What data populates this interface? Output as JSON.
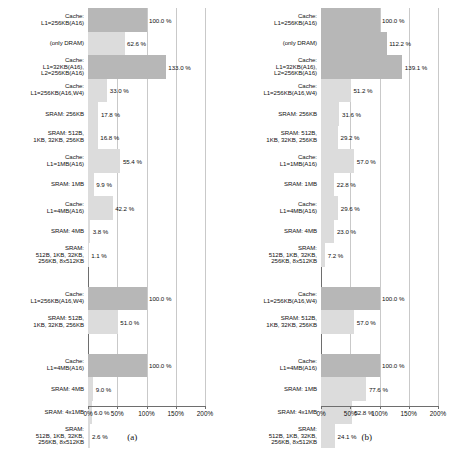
{
  "figure": {
    "type": "grouped-horizontal-bar-figure",
    "panels": 2
  },
  "axis": {
    "ticks": [
      "0%",
      "50%",
      "100%",
      "150%",
      "200%"
    ],
    "tick_values": [
      0,
      50,
      100,
      150,
      200
    ],
    "min": 0,
    "max": 200,
    "unit": "%"
  },
  "colors": {
    "bar_dark": "#b7b7b7",
    "bar_light": "#dcdcdc",
    "axis": "#6e6e6e",
    "grid": "#c9c9c9",
    "background": "#ffffff"
  },
  "panels": [
    {
      "caption": "(a)"
    },
    {
      "caption": "(b)"
    }
  ],
  "chart_data": [
    {
      "type": "bar",
      "orientation": "horizontal",
      "title": "(a)",
      "xlabel": "",
      "ylabel": "",
      "xlim": [
        0,
        200
      ],
      "xticks": [
        0,
        50,
        100,
        150,
        200
      ],
      "xticklabels": [
        "0%",
        "50%",
        "100%",
        "150%",
        "200%"
      ],
      "grid": true,
      "legend": "none",
      "groups": [
        {
          "bars": [
            {
              "label": "Cache:\nL1=256KB(A16)",
              "value": 100.0,
              "value_label": "100.0 %",
              "shade": "dark"
            },
            {
              "label": "(only DRAM)",
              "value": 62.6,
              "value_label": "62.6 %",
              "shade": "light"
            },
            {
              "label": "Cache:\nL1=32KB(A16),\nL2=256KB(A16)",
              "value": 133.0,
              "value_label": "133.0 %",
              "shade": "dark"
            },
            {
              "label": "Cache:\nL1=256KB(A16,W4)",
              "value": 33.0,
              "value_label": "33.0 %",
              "shade": "light"
            },
            {
              "label": "SRAM: 256KB",
              "value": 17.8,
              "value_label": "17.8 %",
              "shade": "light"
            },
            {
              "label": "SRAM: 512B,\n1KB, 32KB, 256KB",
              "value": 16.8,
              "value_label": "16.8 %",
              "shade": "light"
            },
            {
              "label": "Cache:\nL1=1MB(A16)",
              "value": 55.4,
              "value_label": "55.4 %",
              "shade": "light"
            },
            {
              "label": "SRAM: 1MB",
              "value": 9.9,
              "value_label": "9.9 %",
              "shade": "light"
            },
            {
              "label": "Cache:\nL1=4MB(A16)",
              "value": 42.2,
              "value_label": "42.2 %",
              "shade": "light"
            },
            {
              "label": "SRAM: 4MB",
              "value": 3.8,
              "value_label": "3.8 %",
              "shade": "light"
            },
            {
              "label": "SRAM:\n512B, 1KB, 32KB,\n256KB, 8x512KB",
              "value": 1.1,
              "value_label": "1.1 %",
              "shade": "light"
            }
          ]
        },
        {
          "bars": [
            {
              "label": "Cache:\nL1=256KB(A16,W4)",
              "value": 100.0,
              "value_label": "100.0 %",
              "shade": "dark"
            },
            {
              "label": "SRAM: 512B,\n1KB, 32KB, 256KB",
              "value": 51.0,
              "value_label": "51.0 %",
              "shade": "light"
            }
          ]
        },
        {
          "bars": [
            {
              "label": "Cache:\nL1=4MB(A16)",
              "value": 100.0,
              "value_label": "100.0 %",
              "shade": "dark"
            },
            {
              "label": "SRAM: 4MB",
              "value": 9.0,
              "value_label": "9.0 %",
              "shade": "light"
            },
            {
              "label": "SRAM: 4x1MB",
              "value": 6.0,
              "value_label": "6.0 %",
              "shade": "light"
            },
            {
              "label": "SRAM:\n512B, 1KB, 32KB,\n256KB, 8x512KB",
              "value": 2.6,
              "value_label": "2.6 %",
              "shade": "light"
            }
          ]
        }
      ]
    },
    {
      "type": "bar",
      "orientation": "horizontal",
      "title": "(b)",
      "xlabel": "",
      "ylabel": "",
      "xlim": [
        0,
        200
      ],
      "xticks": [
        0,
        50,
        100,
        150,
        200
      ],
      "xticklabels": [
        "0%",
        "50%",
        "100%",
        "150%",
        "200%"
      ],
      "grid": true,
      "legend": "none",
      "groups": [
        {
          "bars": [
            {
              "label": "Cache:\nL1=256KB(A16)",
              "value": 100.0,
              "value_label": "100.0 %",
              "shade": "dark"
            },
            {
              "label": "(only DRAM)",
              "value": 112.2,
              "value_label": "112.2 %",
              "shade": "dark"
            },
            {
              "label": "Cache:\nL1=32KB(A16),\nL2=256KB(A16)",
              "value": 139.1,
              "value_label": "139.1 %",
              "shade": "dark"
            },
            {
              "label": "Cache:\nL1=256KB(A16,W4)",
              "value": 51.2,
              "value_label": "51.2 %",
              "shade": "light"
            },
            {
              "label": "SRAM: 256KB",
              "value": 31.6,
              "value_label": "31.6 %",
              "shade": "light"
            },
            {
              "label": "SRAM: 512B,\n1KB, 32KB, 256KB",
              "value": 29.2,
              "value_label": "29.2 %",
              "shade": "light"
            },
            {
              "label": "Cache:\nL1=1MB(A16)",
              "value": 57.0,
              "value_label": "57.0 %",
              "shade": "light"
            },
            {
              "label": "SRAM: 1MB",
              "value": 22.8,
              "value_label": "22.8 %",
              "shade": "light"
            },
            {
              "label": "Cache:\nL1=4MB(A16)",
              "value": 29.6,
              "value_label": "29.6 %",
              "shade": "light"
            },
            {
              "label": "SRAM: 4MB",
              "value": 23.0,
              "value_label": "23.0 %",
              "shade": "light"
            },
            {
              "label": "SRAM:\n512B, 1KB, 32KB,\n256KB, 8x512KB",
              "value": 7.2,
              "value_label": "7.2 %",
              "shade": "light"
            }
          ]
        },
        {
          "bars": [
            {
              "label": "Cache:\nL1=256KB(A16,W4)",
              "value": 100.0,
              "value_label": "100.0 %",
              "shade": "dark"
            },
            {
              "label": "SRAM: 512B,\n1KB, 32KB, 256KB",
              "value": 57.0,
              "value_label": "57.0 %",
              "shade": "light"
            }
          ]
        },
        {
          "bars": [
            {
              "label": "Cache:\nL1=4MB(A16)",
              "value": 100.0,
              "value_label": "100.0 %",
              "shade": "dark"
            },
            {
              "label": "SRAM: 1MB",
              "value": 77.6,
              "value_label": "77.6 %",
              "shade": "light"
            },
            {
              "label": "SRAM: 4x1MB",
              "value": 52.8,
              "value_label": "52.8 %",
              "shade": "light"
            },
            {
              "label": "SRAM:\n512B, 1KB, 32KB,\n256KB, 8x512KB",
              "value": 24.1,
              "value_label": "24.1 %",
              "shade": "light"
            }
          ]
        }
      ]
    }
  ]
}
